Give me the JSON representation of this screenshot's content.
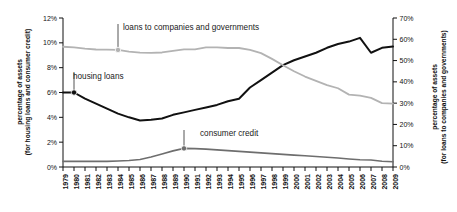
{
  "chart_data": {
    "type": "line",
    "title": "",
    "xlabel": "",
    "ylabel_left": "percentage of assets",
    "ylabel_left_sub": "(for housing loans and consumer credit)",
    "ylabel_right": "percentage of assets",
    "ylabel_right_sub": "(for loans to companies and governments)",
    "grid": false,
    "legend_position": "inline-annotations",
    "x": [
      1979,
      1980,
      1981,
      1982,
      1983,
      1984,
      1985,
      1986,
      1987,
      1988,
      1989,
      1990,
      1991,
      1992,
      1993,
      1994,
      1995,
      1996,
      1997,
      1998,
      1999,
      2000,
      2001,
      2002,
      2003,
      2004,
      2005,
      2006,
      2007,
      2008,
      2009
    ],
    "xtick_labels": [
      "1979",
      "1980",
      "1981",
      "1982",
      "1983",
      "1984",
      "1985",
      "1986",
      "1987",
      "1988",
      "1989",
      "1990",
      "1991",
      "1992",
      "1993",
      "1994",
      "1995",
      "1996",
      "1997",
      "1998",
      "1999",
      "2000",
      "2001",
      "2002",
      "2003",
      "2004",
      "2005",
      "2006",
      "2007",
      "2008",
      "2009"
    ],
    "left_axis": {
      "ylim": [
        0,
        12
      ],
      "ticks": [
        0,
        2,
        4,
        6,
        8,
        10,
        12
      ],
      "tick_labels": [
        "0%",
        "2%",
        "4%",
        "6%",
        "8%",
        "10%",
        "12%"
      ]
    },
    "right_axis": {
      "ylim": [
        0,
        70
      ],
      "ticks": [
        0,
        10,
        20,
        30,
        40,
        50,
        60,
        70
      ],
      "tick_labels": [
        "0%",
        "10%",
        "20%",
        "30%",
        "40%",
        "50%",
        "60%",
        "70%"
      ]
    },
    "series": [
      {
        "name": "housing loans",
        "axis": "left",
        "color": "#111111",
        "width": 2.0,
        "marker_year": 1980,
        "marker_value": 6.0,
        "values": [
          6.0,
          6.0,
          5.5,
          5.1,
          4.7,
          4.3,
          4.0,
          3.75,
          3.8,
          3.9,
          4.2,
          4.4,
          4.6,
          4.8,
          5.0,
          5.3,
          5.5,
          6.4,
          7.0,
          7.6,
          8.2,
          8.6,
          8.9,
          9.2,
          9.6,
          9.9,
          10.1,
          10.4,
          9.2,
          9.6,
          9.7
        ]
      },
      {
        "name": "consumer credit",
        "axis": "left",
        "color": "#6e6e6e",
        "width": 1.6,
        "marker_year": 1990,
        "marker_value": 1.5,
        "values": [
          0.45,
          0.45,
          0.45,
          0.45,
          0.45,
          0.48,
          0.52,
          0.6,
          0.8,
          1.05,
          1.3,
          1.5,
          1.48,
          1.44,
          1.38,
          1.32,
          1.26,
          1.2,
          1.14,
          1.08,
          1.02,
          0.96,
          0.9,
          0.84,
          0.78,
          0.72,
          0.64,
          0.58,
          0.56,
          0.46,
          0.42
        ]
      },
      {
        "name": "loans to companies and governments",
        "axis": "right",
        "color": "#b3b3b3",
        "width": 1.8,
        "marker_year": 1984,
        "marker_value": 55.0,
        "values": [
          56.5,
          56.2,
          55.6,
          55.2,
          55.1,
          55.0,
          54.2,
          53.7,
          53.6,
          53.8,
          54.6,
          55.3,
          55.3,
          56.2,
          56.2,
          55.9,
          55.9,
          55.0,
          53.5,
          50.8,
          47.8,
          45.0,
          42.5,
          40.5,
          38.5,
          37.0,
          34.0,
          33.5,
          32.5,
          30.0,
          29.8
        ]
      }
    ],
    "annotations": [
      {
        "text": "loans to companies and governments",
        "target_year": 1984,
        "target_axis": "right",
        "target_value": 55.0
      },
      {
        "text": "housing loans",
        "target_year": 1980,
        "target_axis": "left",
        "target_value": 6.0
      },
      {
        "text": "consumer credit",
        "target_year": 1990,
        "target_axis": "left",
        "target_value": 1.5
      }
    ]
  }
}
